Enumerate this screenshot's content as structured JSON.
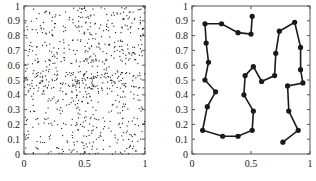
{
  "chart_data": [
    {
      "type": "scatter",
      "title": "",
      "xlabel": "",
      "ylabel": "",
      "xlim": [
        0,
        1
      ],
      "ylim": [
        0,
        1
      ],
      "xticks": [
        "0",
        "0.5",
        "1"
      ],
      "yticks": [
        "0",
        "0.1",
        "0.2",
        "0.3",
        "0.4",
        "0.5",
        "0.6",
        "0.7",
        "0.8",
        "0.9",
        "1"
      ],
      "grid": false,
      "description": "Dense random point cloud (~800 small dots) uniformly covering the unit square, with mild clustering near y=0.5 and x=0.5",
      "point_count_estimate": 800,
      "seed": 7
    },
    {
      "type": "line",
      "title": "",
      "xlabel": "",
      "ylabel": "",
      "xlim": [
        0,
        1
      ],
      "ylim": [
        0,
        1
      ],
      "xticks": [
        "0",
        "0.5",
        "1"
      ],
      "yticks": [
        "0",
        "0.1",
        "0.2",
        "0.3",
        "0.4",
        "0.5",
        "0.6",
        "0.7",
        "0.8",
        "0.9",
        "1"
      ],
      "grid": false,
      "markers": true,
      "series": [
        {
          "name": "path",
          "points": [
            [
              0.51,
              0.93
            ],
            [
              0.5,
              0.81
            ],
            [
              0.39,
              0.82
            ],
            [
              0.25,
              0.88
            ],
            [
              0.11,
              0.88
            ],
            [
              0.12,
              0.75
            ],
            [
              0.14,
              0.62
            ],
            [
              0.11,
              0.5
            ],
            [
              0.2,
              0.42
            ],
            [
              0.13,
              0.32
            ],
            [
              0.09,
              0.16
            ],
            [
              0.26,
              0.12
            ],
            [
              0.39,
              0.12
            ],
            [
              0.51,
              0.16
            ],
            [
              0.52,
              0.29
            ],
            [
              0.44,
              0.4
            ],
            [
              0.45,
              0.53
            ],
            [
              0.52,
              0.59
            ],
            [
              0.59,
              0.49
            ],
            [
              0.7,
              0.53
            ],
            [
              0.71,
              0.68
            ],
            [
              0.74,
              0.83
            ],
            [
              0.87,
              0.89
            ],
            [
              0.92,
              0.72
            ],
            [
              0.92,
              0.57
            ],
            [
              0.94,
              0.48
            ],
            [
              0.81,
              0.46
            ],
            [
              0.82,
              0.29
            ],
            [
              0.9,
              0.16
            ],
            [
              0.77,
              0.08
            ]
          ]
        }
      ]
    }
  ],
  "colors": {
    "ink": "#1a1a1a",
    "frame": "#555555",
    "background": "#ffffff"
  }
}
